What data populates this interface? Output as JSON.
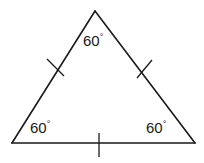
{
  "diagram": {
    "shape": "triangle",
    "vertices": {
      "top": {
        "x": 95,
        "y": 11
      },
      "bottom_left": {
        "x": 12,
        "y": 143
      },
      "bottom_right": {
        "x": 195,
        "y": 143
      }
    },
    "angles": [
      {
        "name": "top",
        "value": "60",
        "unit": "°"
      },
      {
        "name": "bottom-left",
        "value": "60",
        "unit": "°"
      },
      {
        "name": "bottom-right",
        "value": "60",
        "unit": "°"
      }
    ],
    "congruence_marks": [
      {
        "side": "left",
        "count": 1
      },
      {
        "side": "right",
        "count": 1
      },
      {
        "side": "bottom",
        "count": 1
      }
    ],
    "colors": {
      "stroke": "#1a1a1a",
      "background": "#ffffff"
    }
  }
}
